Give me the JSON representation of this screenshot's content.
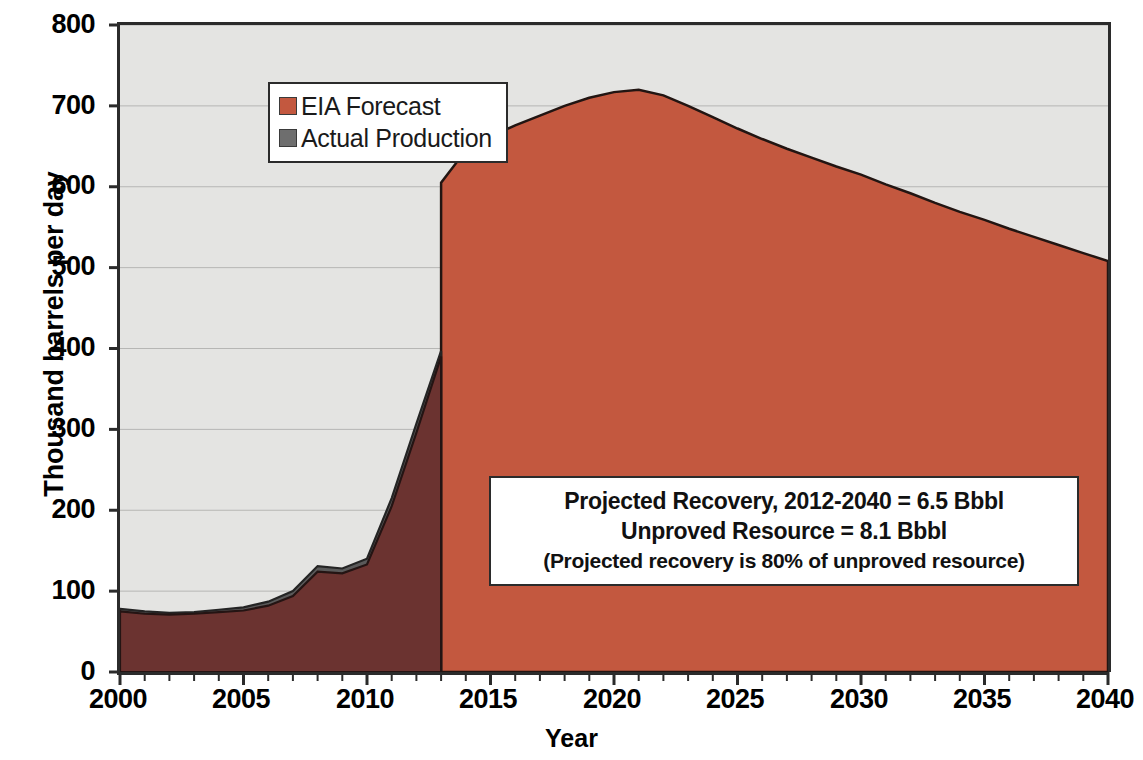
{
  "chart_data": {
    "type": "area",
    "title": "",
    "xlabel": "Year",
    "ylabel": "Thousand barrels per day",
    "xlim": [
      2000,
      2040
    ],
    "ylim": [
      0,
      800
    ],
    "ytick_labels": [
      "800",
      "700",
      "600",
      "500",
      "400",
      "300",
      "200",
      "100",
      "0"
    ],
    "ytick_values": [
      800,
      700,
      600,
      500,
      400,
      300,
      200,
      100,
      0
    ],
    "xtick_labels": [
      "2000",
      "2005",
      "2010",
      "2015",
      "2020",
      "2025",
      "2030",
      "2035",
      "2040"
    ],
    "xtick_values": [
      2000,
      2005,
      2010,
      2015,
      2020,
      2025,
      2030,
      2035,
      2040
    ],
    "x_minor_tick_interval": 1,
    "grid": "horizontal",
    "legend_position": "top-left",
    "series": [
      {
        "name": "EIA Forecast",
        "color": "#c3583f",
        "historical_color": "#6b3330",
        "x": [
          2000,
          2001,
          2002,
          2003,
          2004,
          2005,
          2006,
          2007,
          2008,
          2009,
          2010,
          2011,
          2012,
          2013,
          2013,
          2014,
          2015,
          2016,
          2017,
          2018,
          2019,
          2020,
          2021,
          2022,
          2023,
          2024,
          2025,
          2026,
          2027,
          2028,
          2029,
          2030,
          2031,
          2032,
          2033,
          2034,
          2035,
          2036,
          2037,
          2038,
          2039,
          2040
        ],
        "values": [
          75,
          72,
          71,
          72,
          74,
          76,
          82,
          94,
          124,
          122,
          133,
          205,
          296,
          390,
          605,
          645,
          662,
          676,
          688,
          700,
          710,
          717,
          720,
          713,
          700,
          686,
          672,
          659,
          647,
          636,
          625,
          615,
          603,
          592,
          580,
          569,
          559,
          548,
          538,
          528,
          518,
          508
        ]
      },
      {
        "name": "Actual Production",
        "color": "#5a5a5a",
        "x": [
          2000,
          2001,
          2002,
          2003,
          2004,
          2005,
          2006,
          2007,
          2008,
          2009,
          2010,
          2011,
          2012,
          2013
        ],
        "values": [
          78,
          75,
          73,
          74,
          77,
          80,
          87,
          100,
          131,
          128,
          140,
          215,
          307,
          397
        ]
      }
    ],
    "annotations": [
      {
        "name": "projection-summary",
        "lines": [
          "Projected Recovery, 2012-2040 = 6.5 Bbbl",
          "Unproved Resource = 8.1 Bbbl",
          "(Projected recovery is 80% of unproved resource)"
        ]
      }
    ],
    "colors": {
      "forecast_fill": "#c3583f",
      "historical_fill": "#6b3330",
      "actual_fill": "#5a5a5a",
      "plot_background": "#e4e4e2",
      "axis": "#2b2b2b",
      "gridline": "#b6b6b4"
    }
  },
  "legend": {
    "items": [
      {
        "label": "EIA Forecast",
        "color": "#c3583f"
      },
      {
        "label": "Actual Production",
        "color": "#5a5a5a"
      }
    ]
  },
  "axes": {
    "y_title": "Thousand barrels per day",
    "x_title": "Year"
  }
}
